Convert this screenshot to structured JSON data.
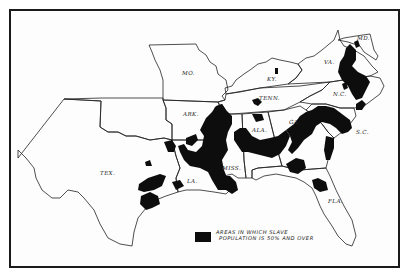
{
  "map": {
    "subject": "Southern United States — slave population distribution",
    "state_labels": [
      {
        "id": "mo",
        "text": "MO.",
        "x": 182,
        "y": 75
      },
      {
        "id": "ky",
        "text": "KY.",
        "x": 267,
        "y": 81
      },
      {
        "id": "tenn",
        "text": "TENN.",
        "x": 259,
        "y": 100
      },
      {
        "id": "va",
        "text": "VA.",
        "x": 324,
        "y": 64
      },
      {
        "id": "md",
        "text": "MD.",
        "x": 357,
        "y": 40
      },
      {
        "id": "nc",
        "text": "N.C.",
        "x": 333,
        "y": 96
      },
      {
        "id": "ark",
        "text": "ARK.",
        "x": 183,
        "y": 116
      },
      {
        "id": "ala",
        "text": "ALA.",
        "x": 252,
        "y": 132
      },
      {
        "id": "ga",
        "text": "GA.",
        "x": 289,
        "y": 124
      },
      {
        "id": "sc",
        "text": "S.C.",
        "x": 356,
        "y": 134
      },
      {
        "id": "tex",
        "text": "TEX.",
        "x": 100,
        "y": 175
      },
      {
        "id": "la",
        "text": "LA.",
        "x": 187,
        "y": 183
      },
      {
        "id": "miss",
        "text": "MISS.",
        "x": 222,
        "y": 170
      },
      {
        "id": "fla",
        "text": "FLA.",
        "x": 328,
        "y": 203
      }
    ]
  },
  "legend": {
    "swatch_color": "#0d0d0d",
    "line1": "AREAS IN WHICH SLAVE",
    "line2": "POPULATION IS 50% AND OVER"
  },
  "colors": {
    "ink": "#0d0d0d",
    "outline": "#222222",
    "paper": "#fdfdfd"
  }
}
